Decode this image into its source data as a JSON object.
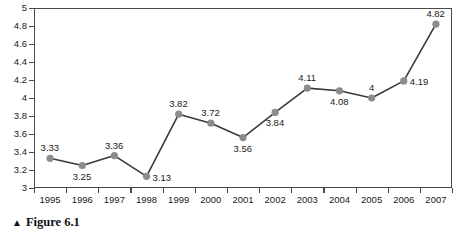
{
  "caption": {
    "marker": "▲",
    "text": "Figure 6.1"
  },
  "colors": {
    "marker": "#8c8c8c",
    "line": "#3a3a3a",
    "axis": "#4a4a4a",
    "text": "#1a1a1a",
    "background": "#ffffff"
  },
  "chart_data": {
    "type": "line",
    "title": "",
    "subtitle": "",
    "xlabel": "",
    "ylabel": "",
    "categories": [
      "1995",
      "1996",
      "1997",
      "1998",
      "1999",
      "2000",
      "2001",
      "2002",
      "2003",
      "2004",
      "2005",
      "2006",
      "2007"
    ],
    "values": [
      3.33,
      3.25,
      3.36,
      3.13,
      3.82,
      3.72,
      3.56,
      3.84,
      4.11,
      4.08,
      4,
      4.19,
      4.82
    ],
    "point_labels": [
      "3.33",
      "3.25",
      "3.36",
      "3.13",
      "3.82",
      "3.72",
      "3.56",
      "3.84",
      "4.11",
      "4.08",
      "4",
      "4.19",
      "4.82"
    ],
    "label_positions": [
      "above",
      "below",
      "above",
      "right",
      "above",
      "above",
      "below",
      "below",
      "above",
      "below",
      "above",
      "right",
      "above"
    ],
    "ylim": [
      3,
      5
    ],
    "ytick_step": 0.2,
    "ytick_labels": [
      "3",
      "3.2",
      "3.4",
      "3.6",
      "3.8",
      "4",
      "4.2",
      "4.4",
      "4.6",
      "4.8",
      "5"
    ],
    "ytick_values": [
      3,
      3.2,
      3.4,
      3.6,
      3.8,
      4,
      4.2,
      4.4,
      4.6,
      4.8,
      5
    ],
    "grid": false,
    "legend": false,
    "legend_position": "none",
    "markers": "circle",
    "annotations": []
  }
}
